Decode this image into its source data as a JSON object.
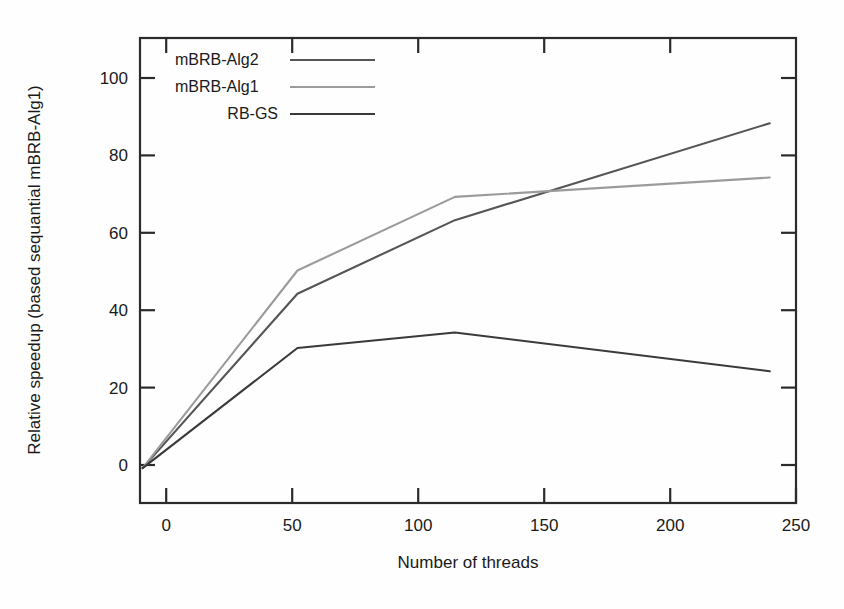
{
  "chart_data": {
    "type": "line",
    "title": "",
    "xlabel": "Number of threads",
    "ylabel": "Relative speedup (based sequantial mBRB-Alg1)",
    "xlim": [
      0,
      250
    ],
    "ylim": [
      -8,
      112
    ],
    "xticks": [
      0,
      50,
      100,
      150,
      200,
      250
    ],
    "yticks": [
      0,
      20,
      40,
      60,
      80,
      100
    ],
    "xtick_labels": [
      "0",
      "50",
      "100",
      "150",
      "200",
      "250"
    ],
    "ytick_labels": [
      "0",
      "20",
      "40",
      "60",
      "80",
      "100"
    ],
    "grid": false,
    "legend_position": "top-left-inside",
    "x": [
      1,
      60,
      120,
      240
    ],
    "series": [
      {
        "name": "mBRB-Alg2",
        "color": "#555555",
        "values": [
          1,
          46,
          65,
          90
        ]
      },
      {
        "name": "mBRB-Alg1",
        "color": "#9b9b9b",
        "values": [
          1,
          52,
          71,
          76
        ]
      },
      {
        "name": "RB-GS",
        "color": "#3a3a3a",
        "values": [
          1,
          32,
          36,
          26
        ]
      }
    ]
  },
  "legend": {
    "entries": [
      {
        "label": "mBRB-Alg2"
      },
      {
        "label": "mBRB-Alg1"
      },
      {
        "label": "RB-GS"
      }
    ]
  },
  "axes": {
    "x_title": "Number of threads",
    "y_title": "Relative speedup (based sequantial mBRB-Alg1)"
  }
}
